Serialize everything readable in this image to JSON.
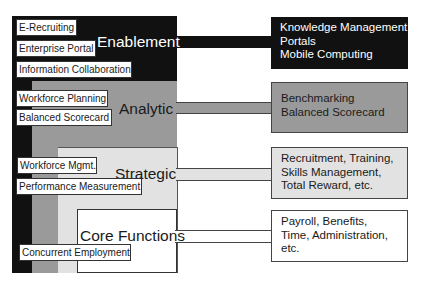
{
  "diagram": {
    "layers": [
      {
        "id": "enablement",
        "title": "Enablement",
        "color": "#111111",
        "items": [
          "E-Recruiting",
          "Enterprise Portal",
          "Information Collaboration"
        ],
        "detail": "Knowledge Management\nPortals\nMobile Computing"
      },
      {
        "id": "analytic",
        "title": "Analytic",
        "color": "#9a9a9a",
        "items": [
          "Workforce Planning",
          "Balanced Scorecard"
        ],
        "detail": "Benchmarking\nBalanced Scorecard"
      },
      {
        "id": "strategic",
        "title": "Strategic",
        "color": "#e2e2e2",
        "items": [
          "Workforce Mgmt.",
          "Performance Measurement"
        ],
        "detail": "Recruitment, Training,\nSkills Management,\nTotal Reward, etc."
      },
      {
        "id": "core",
        "title": "Core Functions",
        "color": "#ffffff",
        "items": [
          "Concurrent Employment"
        ],
        "detail": "Payroll, Benefits,\nTime, Administration,\netc."
      }
    ]
  }
}
